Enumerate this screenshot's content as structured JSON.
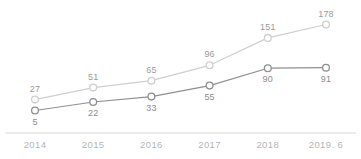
{
  "chart_data": {
    "type": "line",
    "title": "",
    "subtitle": "",
    "xlabel": "",
    "ylabel": "",
    "categories": [
      "2014",
      "2015",
      "2016",
      "2017",
      "2018",
      "2019. 6"
    ],
    "series": [
      {
        "name": "upper-series",
        "color": "#cfcfcf",
        "label_position": "above",
        "values": [
          27,
          51,
          65,
          96,
          151,
          178
        ]
      },
      {
        "name": "lower-series",
        "color": "#8f8f8f",
        "label_position": "below",
        "values": [
          5,
          22,
          33,
          55,
          90,
          91
        ]
      }
    ],
    "ylim": [
      0,
      195
    ],
    "grid": false,
    "legend": "none",
    "marker": "open-circle",
    "axis": {
      "x_axis_visible": true,
      "y_axis_visible": false,
      "axis_color": "#d8d8d8"
    }
  },
  "colors": {
    "upper_line": "#cfcfcf",
    "lower_line": "#8f8f8f",
    "axis": "#d8d8d8",
    "tick_text": "#b5b5b5",
    "label_text": "#9a9a9a",
    "marker_fill": "#ffffff"
  }
}
